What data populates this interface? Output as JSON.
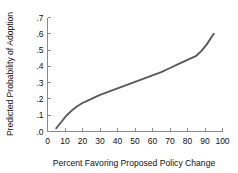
{
  "chart_data": {
    "type": "line",
    "title": "",
    "subtitle": "",
    "xlabel": "Percent Favoring Proposed Policy Change",
    "ylabel": "Predicted Probability of Adoption",
    "xlim": [
      0,
      100
    ],
    "ylim": [
      0.0,
      0.7
    ],
    "grid": false,
    "legend": null,
    "legend_position": "none",
    "xticks": [
      0,
      10,
      20,
      30,
      40,
      50,
      60,
      70,
      80,
      90,
      100
    ],
    "xtick_labels": [
      "0",
      "10",
      "20",
      "30",
      "40",
      "50",
      "60",
      "70",
      "80",
      "90",
      "100"
    ],
    "yticks": [
      0.0,
      0.1,
      0.2,
      0.3,
      0.4,
      0.5,
      0.6,
      0.7
    ],
    "ytick_labels": [
      ".0",
      ".1",
      ".2",
      ".3",
      ".4",
      ".5",
      ".6",
      ".7"
    ],
    "series": [
      {
        "name": "Predicted Probability of Adoption",
        "color": "#5a5a5a",
        "x": [
          5,
          8,
          11,
          14,
          17,
          20,
          23,
          26,
          30,
          35,
          40,
          45,
          50,
          55,
          60,
          65,
          70,
          75,
          80,
          85,
          88,
          91,
          95
        ],
        "values": [
          0.02,
          0.06,
          0.1,
          0.13,
          0.155,
          0.175,
          0.19,
          0.205,
          0.225,
          0.245,
          0.265,
          0.285,
          0.305,
          0.325,
          0.345,
          0.365,
          0.39,
          0.415,
          0.44,
          0.465,
          0.495,
          0.535,
          0.6
        ]
      }
    ],
    "annotations": []
  },
  "axis": {
    "x_title": "Percent Favoring Proposed Policy Change",
    "y_title": "Predicted Probability of Adoption"
  },
  "colors": {
    "curve": "#5a5a5a",
    "axis": "#8a8a8a",
    "text": "#111111",
    "background": "#ffffff"
  }
}
